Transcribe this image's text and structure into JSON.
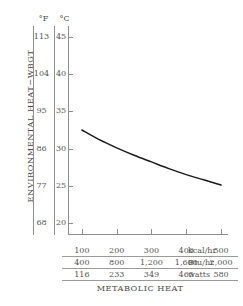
{
  "chart_data": {
    "type": "line",
    "title": "METABOLIC HEAT",
    "ylabel": "ENVIRONMENTAL HEAT−WBGT",
    "xlabel": "METABOLIC HEAT",
    "grid": false,
    "legend": "none",
    "x": [
      100,
      150,
      200,
      250,
      300,
      350,
      400,
      450,
      500
    ],
    "xunit": "kcal/hr",
    "yunit": "°C",
    "values": [
      32.5,
      31.2,
      30.1,
      29.1,
      28.2,
      27.3,
      26.5,
      25.8,
      25.1
    ],
    "series": [
      {
        "name": "WBGT limit curve",
        "values": [
          32.5,
          31.2,
          30.1,
          29.1,
          28.2,
          27.3,
          26.5,
          25.8,
          25.1
        ]
      }
    ],
    "xlim": [
      60,
      520
    ],
    "ylim": [
      18.5,
      46.5
    ],
    "y_axis_celsius": {
      "label": "°C",
      "ticks": [
        45,
        40,
        35,
        30,
        25,
        20
      ]
    },
    "y_axis_fahrenheit": {
      "label": "°F",
      "ticks": [
        113,
        104,
        95,
        86,
        77,
        68
      ]
    },
    "x_axis_rows": [
      {
        "unit": "kcal/hr",
        "ticks": [
          "100",
          "200",
          "300",
          "400",
          "500"
        ]
      },
      {
        "unit": "Btu/hr",
        "ticks": [
          "400",
          "800",
          "1,200",
          "1,600",
          "2,000"
        ]
      },
      {
        "unit": "watts",
        "ticks": [
          "116",
          "233",
          "349",
          "465",
          "580"
        ]
      }
    ]
  },
  "colors": {
    "axis": "#8e8e8e",
    "text": "#555555",
    "curve": "#1a1a1a",
    "background": "#ffffff"
  }
}
